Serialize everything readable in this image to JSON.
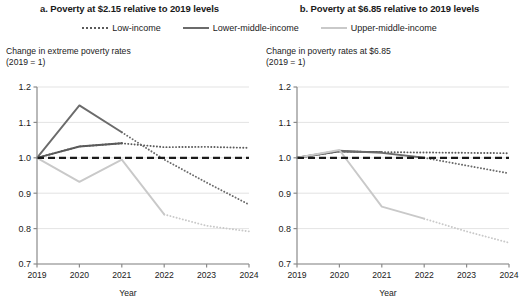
{
  "legend": {
    "items": [
      {
        "label": "Low-income",
        "style": "dotted",
        "color": "#5a5a5a",
        "icon": "dotted-line-swatch"
      },
      {
        "label": "Lower-middle-income",
        "style": "solid",
        "color": "#6b6b6b",
        "icon": "solid-line-swatch"
      },
      {
        "label": "Upper-middle-income",
        "style": "solid",
        "color": "#c9c9c9",
        "icon": "light-solid-line-swatch"
      }
    ]
  },
  "panels": [
    {
      "id": "panel-a",
      "title": "a. Poverty at $2.15 relative to 2019 levels",
      "caption_line1": "Change in extreme poverty rates",
      "caption_line2": "(2019 = 1)",
      "xlabel": "Year"
    },
    {
      "id": "panel-b",
      "title": "b. Poverty at $6.85 relative to 2019 levels",
      "caption_line1": "Change in poverty rates at $6.85",
      "caption_line2": "(2019 = 1)",
      "xlabel": "Year"
    }
  ],
  "axis": {
    "yticks": [
      "1.2",
      "1.1",
      "1.0",
      "0.9",
      "0.8",
      "0.7"
    ],
    "xticks": [
      "2019",
      "2020",
      "2021",
      "2022",
      "2023",
      "2024"
    ]
  },
  "chart_data": [
    {
      "type": "line",
      "title": "a. Poverty at $2.15 relative to 2019 levels",
      "subtitle": "Change in extreme poverty rates (2019 = 1)",
      "xlabel": "Year",
      "ylabel": "Change in extreme poverty rates (2019 = 1)",
      "x": [
        2019,
        2020,
        2021,
        2022,
        2023,
        2024
      ],
      "ylim": [
        0.7,
        1.2
      ],
      "xlim": [
        2019,
        2024
      ],
      "grid": true,
      "legend_position": "top-center",
      "reference_line": {
        "value": 1.0,
        "style": "dashed",
        "color": "#1a1a1a"
      },
      "series": [
        {
          "name": "Low-income",
          "color": "#5a5a5a",
          "style": "dotted",
          "values": [
            1.0,
            1.032,
            1.041,
            1.03,
            1.031,
            1.028
          ],
          "projection_from": 2021,
          "projection_values": [
            1.041,
            1.03,
            1.031,
            1.028
          ]
        },
        {
          "name": "Lower-middle-income",
          "color": "#6b6b6b",
          "style": "solid",
          "values": [
            1.0,
            1.148,
            1.072,
            0.995,
            0.93,
            0.868
          ],
          "projection_from": 2021,
          "projection_values": [
            1.072,
            0.995,
            0.93,
            0.868
          ]
        },
        {
          "name": "Upper-middle-income",
          "color": "#c9c9c9",
          "style": "solid",
          "values": [
            1.0,
            0.932,
            0.995,
            0.84,
            0.808,
            0.792
          ],
          "projection_from": 2022,
          "projection_values": [
            0.84,
            0.808,
            0.792
          ]
        }
      ]
    },
    {
      "type": "line",
      "title": "b. Poverty at $6.85 relative to 2019 levels",
      "subtitle": "Change in poverty rates at $6.85 (2019 = 1)",
      "xlabel": "Year",
      "ylabel": "Change in poverty rates at $6.85 (2019 = 1)",
      "x": [
        2019,
        2020,
        2021,
        2022,
        2023,
        2024
      ],
      "ylim": [
        0.7,
        1.2
      ],
      "xlim": [
        2019,
        2024
      ],
      "grid": true,
      "legend_position": "top-center",
      "reference_line": {
        "value": 1.0,
        "style": "dashed",
        "color": "#1a1a1a"
      },
      "series": [
        {
          "name": "Low-income",
          "color": "#5a5a5a",
          "style": "dotted",
          "values": [
            1.0,
            1.018,
            1.016,
            1.015,
            1.014,
            1.013
          ],
          "projection_from": 2021,
          "projection_values": [
            1.016,
            1.015,
            1.014,
            1.013
          ]
        },
        {
          "name": "Lower-middle-income",
          "color": "#6b6b6b",
          "style": "solid",
          "values": [
            1.0,
            1.02,
            1.014,
            1.0,
            0.978,
            0.956
          ],
          "projection_from": 2022,
          "projection_values": [
            1.0,
            0.978,
            0.956
          ]
        },
        {
          "name": "Upper-middle-income",
          "color": "#c9c9c9",
          "style": "solid",
          "values": [
            1.0,
            1.022,
            0.862,
            0.828,
            0.792,
            0.76
          ],
          "projection_from": 2022,
          "projection_values": [
            0.828,
            0.792,
            0.76
          ]
        }
      ]
    }
  ]
}
